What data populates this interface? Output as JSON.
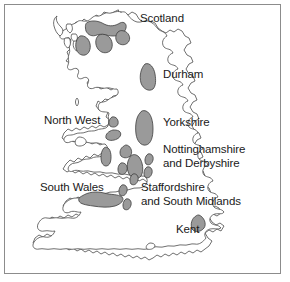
{
  "figure": {
    "kind": "map-diagram",
    "frame_color": "#8c8c8c",
    "background_color": "#ffffff",
    "coast_outline_color": "#4a4a4a",
    "region_fill_color": "#9a9a9a",
    "region_outline_color": "#3d3d3d",
    "label_color": "#1a1a1a"
  },
  "labels": [
    {
      "id": "scotland",
      "text": "Scotland",
      "x": 140,
      "y": 12
    },
    {
      "id": "durham",
      "text": "Durham",
      "x": 163,
      "y": 68
    },
    {
      "id": "north-west",
      "text": "North West",
      "x": 44,
      "y": 114
    },
    {
      "id": "yorkshire",
      "text": "Yorkshire",
      "x": 163,
      "y": 116
    },
    {
      "id": "nottinghamshire-and-derbyshire",
      "text": "Nottinghamshire\nand Derbyshire",
      "x": 163,
      "y": 143
    },
    {
      "id": "south-wales",
      "text": "South Wales",
      "x": 40,
      "y": 181
    },
    {
      "id": "staffordshire-and-south-midlands",
      "text": "Staffordshire\nand South Midlands",
      "x": 141,
      "y": 181
    },
    {
      "id": "kent",
      "text": "Kent",
      "x": 176,
      "y": 223
    }
  ],
  "regions": [
    {
      "id": "scotland-central-belt-west",
      "name": "Scotland western coalfield"
    },
    {
      "id": "scotland-central-belt-east",
      "name": "Scotland eastern coalfield"
    },
    {
      "id": "scotland-fife",
      "name": "Scotland Fife coalfield"
    },
    {
      "id": "scotland-ayrshire",
      "name": "Scotland Ayrshire coalfield"
    },
    {
      "id": "durham-coalfield",
      "name": "Durham coalfield"
    },
    {
      "id": "yorkshire-coalfield",
      "name": "Yorkshire coalfield"
    },
    {
      "id": "north-west-lancashire",
      "name": "North West Lancashire coalfield"
    },
    {
      "id": "north-west-small",
      "name": "North West small coalfield"
    },
    {
      "id": "north-wales",
      "name": "North Wales coalfield"
    },
    {
      "id": "nottinghamshire-derbyshire",
      "name": "Nottinghamshire and Derbyshire coalfield"
    },
    {
      "id": "nottinghamshire-east",
      "name": "Nottinghamshire eastern coalfield"
    },
    {
      "id": "staffordshire-north",
      "name": "North Staffordshire coalfield"
    },
    {
      "id": "staffordshire-south",
      "name": "South Staffordshire coalfield"
    },
    {
      "id": "leicestershire",
      "name": "Leicestershire coalfield"
    },
    {
      "id": "warwickshire",
      "name": "Warwickshire coalfield"
    },
    {
      "id": "south-wales-coalfield",
      "name": "South Wales coalfield"
    },
    {
      "id": "forest-of-dean",
      "name": "Forest of Dean coalfield"
    },
    {
      "id": "bristol-somerset",
      "name": "Bristol and Somerset coalfield"
    },
    {
      "id": "kent-coalfield",
      "name": "Kent coalfield"
    }
  ]
}
